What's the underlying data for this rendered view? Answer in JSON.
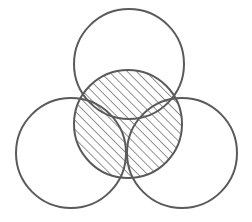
{
  "diagram": {
    "type": "venn-overlap",
    "colors": {
      "stroke": "#5a5a5a",
      "hatch": "#5a5a5a",
      "background": "#ffffff"
    },
    "hatch": {
      "angle": 45,
      "spacing": 6.5,
      "width": 1.3
    },
    "circles": [
      {
        "id": "top",
        "cx": 129,
        "cy": 64,
        "r": 55,
        "hatched": false
      },
      {
        "id": "left",
        "cx": 71,
        "cy": 153,
        "r": 55,
        "hatched": false
      },
      {
        "id": "right",
        "cx": 182,
        "cy": 153,
        "r": 55,
        "hatched": false
      },
      {
        "id": "center",
        "cx": 128,
        "cy": 124,
        "r": 54,
        "hatched": true
      }
    ]
  }
}
